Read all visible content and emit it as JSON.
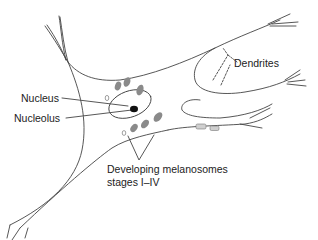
{
  "diagram": {
    "type": "melanocyte-cell",
    "labels": {
      "dendrites": "Dendrites",
      "nucleus": "Nucleus",
      "nucleolus": "Nucleolus",
      "melanosomes_line1": "Developing melanosomes",
      "melanosomes_line2": "stages I–IV"
    },
    "colors": {
      "outline": "#444444",
      "melanosome_fill": "#8a8a8a",
      "nucleolus_fill": "#111111",
      "label_text": "#222222"
    }
  }
}
